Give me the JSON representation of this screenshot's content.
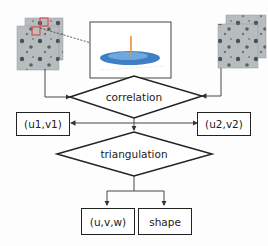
{
  "nodes": {
    "correlation": "correlation",
    "uv1": "(u1,v1)",
    "uv2": "(u2,v2)",
    "triangulation": "triangulation",
    "uvw": "(u,v,w)",
    "shape": "shape"
  },
  "images": {
    "left_stack": "speckle-image-left",
    "right_stack": "speckle-image-right",
    "correlation_plot": "correlation-peak-3d-plot"
  },
  "colors": {
    "subset_highlight": "#d9534f",
    "surface": "#3f7fc6",
    "line": "#222222"
  }
}
